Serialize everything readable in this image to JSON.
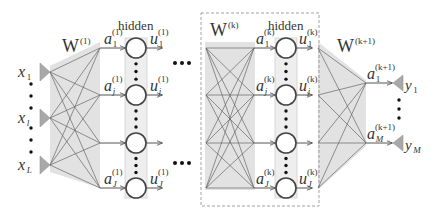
{
  "inputs": [
    {
      "label": "x",
      "sub": "1",
      "y": 72
    },
    {
      "label": "x",
      "sub": "l",
      "y": 118
    },
    {
      "label": "x",
      "sub": "L",
      "y": 165
    }
  ],
  "outputs": [
    {
      "label": "y",
      "sub": "1",
      "y": 83
    },
    {
      "label": "y",
      "sub": "M",
      "y": 143
    }
  ],
  "layer1": {
    "weight_label": "W",
    "weight_sup": "(1)",
    "hidden_label": "hidden",
    "pre_labels": [
      {
        "a": "a",
        "sub": "1",
        "sup": "(1)"
      },
      {
        "a": "a",
        "sub": "j",
        "sup": "(1)"
      },
      {
        "a": "a",
        "sub": "J",
        "sup": "(1)"
      }
    ],
    "post_labels": [
      {
        "u": "u",
        "sub": "1",
        "sup": "(1)"
      },
      {
        "u": "u",
        "sub": "j",
        "sup": "(1)"
      },
      {
        "u": "u",
        "sub": "J",
        "sup": "(1)"
      }
    ]
  },
  "layerk": {
    "weight_label": "W",
    "weight_sup": "(k)",
    "hidden_label": "hidden",
    "pre_labels": [
      {
        "a": "a",
        "sub": "1",
        "sup": "(k)"
      },
      {
        "a": "a",
        "sub": "j",
        "sup": "(k)"
      },
      {
        "a": "a",
        "sub": "J",
        "sup": "(k)"
      }
    ],
    "post_labels": [
      {
        "u": "u",
        "sub": "1",
        "sup": "(k)"
      },
      {
        "u": "u",
        "sub": "j",
        "sup": "(k)"
      },
      {
        "u": "u",
        "sub": "J",
        "sup": "(k)"
      }
    ]
  },
  "output_layer": {
    "weight_label": "W",
    "weight_sup": "(k+1)",
    "pre_labels": [
      {
        "a": "a",
        "sub": "1",
        "sup": "(k+1)"
      },
      {
        "a": "a",
        "sub": "M",
        "sup": "(k+1)"
      }
    ]
  },
  "ellipsis": "•••",
  "colors": {
    "stroke": "#555555",
    "shade": "#e2e2e2",
    "hidden_box": "#eeeeee",
    "triangle": "#a8a8a8",
    "dashed": "#888888"
  }
}
